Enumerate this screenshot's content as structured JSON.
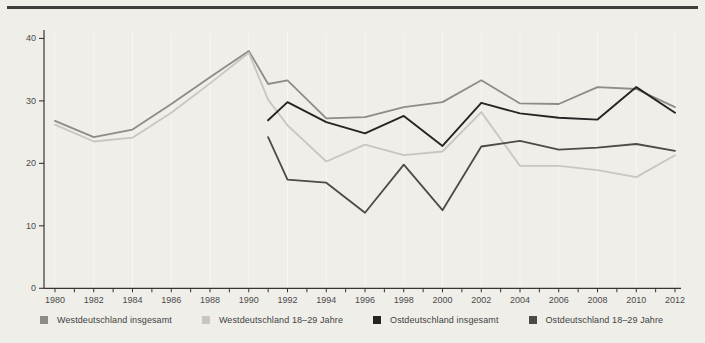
{
  "page": {
    "background_color": "#f0eee9",
    "top_rule_color": "#403d3e",
    "axis_color": "#373435",
    "gridline_color": "#f9f8f3",
    "tick_label_color": "#4a4a4a"
  },
  "chart_data": {
    "type": "line",
    "title": "",
    "xlabel": "",
    "ylabel": "",
    "ylim": [
      0,
      42
    ],
    "xlim": [
      1978.9,
      2012.6
    ],
    "grid": "faint vertical gridlines at even-year ticks",
    "legend_position": "bottom-left",
    "y_ticks": [
      0,
      10,
      20,
      30,
      40
    ],
    "y_tick_labels": [
      "0",
      "10",
      "20",
      "30",
      "40"
    ],
    "x_ticks": [
      1980,
      1982,
      1984,
      1986,
      1988,
      1990,
      1992,
      1994,
      1996,
      1998,
      2000,
      2002,
      2004,
      2006,
      2008,
      2010,
      2012
    ],
    "x_tick_labels": [
      "1980",
      "1982",
      "1984",
      "1986",
      "1988",
      "1990",
      "1992",
      "1994",
      "1996",
      "1998",
      "2000",
      "2002",
      "2004",
      "2006",
      "2008",
      "2010",
      "2012"
    ],
    "x": [
      1980,
      1982,
      1984,
      1986,
      1988,
      1990,
      1991,
      1992,
      1994,
      1996,
      1998,
      2000,
      2002,
      2004,
      2006,
      2008,
      2010,
      2012
    ],
    "series": [
      {
        "name": "Westdeutschland insgesamt",
        "color": "#8e8b88",
        "values": [
          26.8,
          24.2,
          25.4,
          29.5,
          33.8,
          38.0,
          32.7,
          33.3,
          27.2,
          27.4,
          29.0,
          29.8,
          33.3,
          29.6,
          29.5,
          32.2,
          31.9,
          29.0
        ]
      },
      {
        "name": "Westdeutschland 18–29 Jahre",
        "color": "#c9c6c0",
        "values": [
          26.2,
          23.5,
          24.1,
          28.1,
          32.8,
          37.7,
          30.2,
          26.1,
          20.3,
          23.0,
          21.3,
          21.9,
          28.2,
          19.6,
          19.6,
          18.9,
          17.8,
          21.3
        ]
      },
      {
        "name": "Ostdeutschland insgesamt",
        "color": "#262324",
        "values": [
          null,
          null,
          null,
          null,
          null,
          null,
          26.9,
          29.8,
          26.6,
          24.8,
          27.6,
          22.8,
          29.7,
          28.0,
          27.3,
          27.0,
          32.2,
          28.1
        ]
      },
      {
        "name": "Ostdeutschland 18–29 Jahre",
        "color": "#4f4947",
        "values": [
          null,
          null,
          null,
          null,
          null,
          null,
          24.2,
          17.4,
          16.9,
          12.1,
          19.8,
          12.5,
          22.7,
          23.6,
          22.2,
          22.5,
          23.1,
          22.0
        ]
      }
    ]
  }
}
